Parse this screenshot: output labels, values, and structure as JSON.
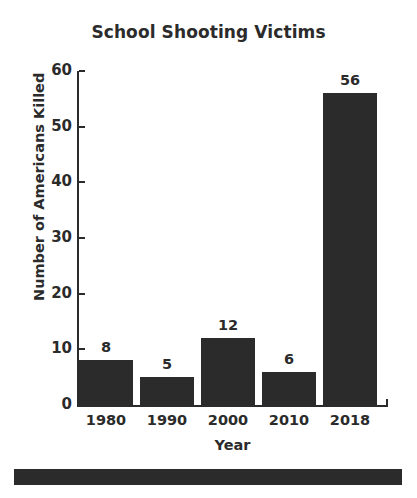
{
  "chart_data": {
    "type": "bar",
    "title": "School Shooting Victims",
    "xlabel": "Year",
    "ylabel": "Number of Americans Killed",
    "categories": [
      "1980",
      "1990",
      "2000",
      "2010",
      "2018"
    ],
    "values": [
      8,
      5,
      12,
      6,
      56
    ],
    "value_labels": [
      "8",
      "5",
      "12",
      "6",
      "56"
    ],
    "ylim": [
      0,
      60
    ],
    "yticks": [
      0,
      10,
      20,
      30,
      40,
      50,
      60
    ],
    "ytick_labels": [
      "0",
      "10",
      "20",
      "30",
      "40",
      "50",
      "60"
    ],
    "grid": false,
    "legend": null,
    "bar_color": "#2b2b2b",
    "background_color": "#ffffff",
    "text_color": "#2b2b2b"
  },
  "decoration": {
    "bottom_rule_color": "#2b2b2b"
  }
}
